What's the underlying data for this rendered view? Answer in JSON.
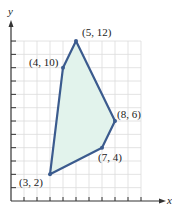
{
  "chart_data": {
    "type": "scatter",
    "title": "",
    "xlabel": "x",
    "ylabel": "y",
    "xlim": [
      0,
      10
    ],
    "ylim": [
      0,
      12
    ],
    "grid": true,
    "polygon": {
      "vertices": [
        {
          "x": 3,
          "y": 2,
          "label": "(3, 2)"
        },
        {
          "x": 4,
          "y": 10,
          "label": "(4, 10)"
        },
        {
          "x": 5,
          "y": 12,
          "label": "(5, 12)"
        },
        {
          "x": 8,
          "y": 6,
          "label": "(8, 6)"
        },
        {
          "x": 7,
          "y": 4,
          "label": "(7, 4)"
        }
      ],
      "fill_color": "#e2f3ec",
      "stroke_color": "#3b5b8e"
    },
    "colors": {
      "grid": "#dcdcdc",
      "axis": "#333333"
    }
  }
}
